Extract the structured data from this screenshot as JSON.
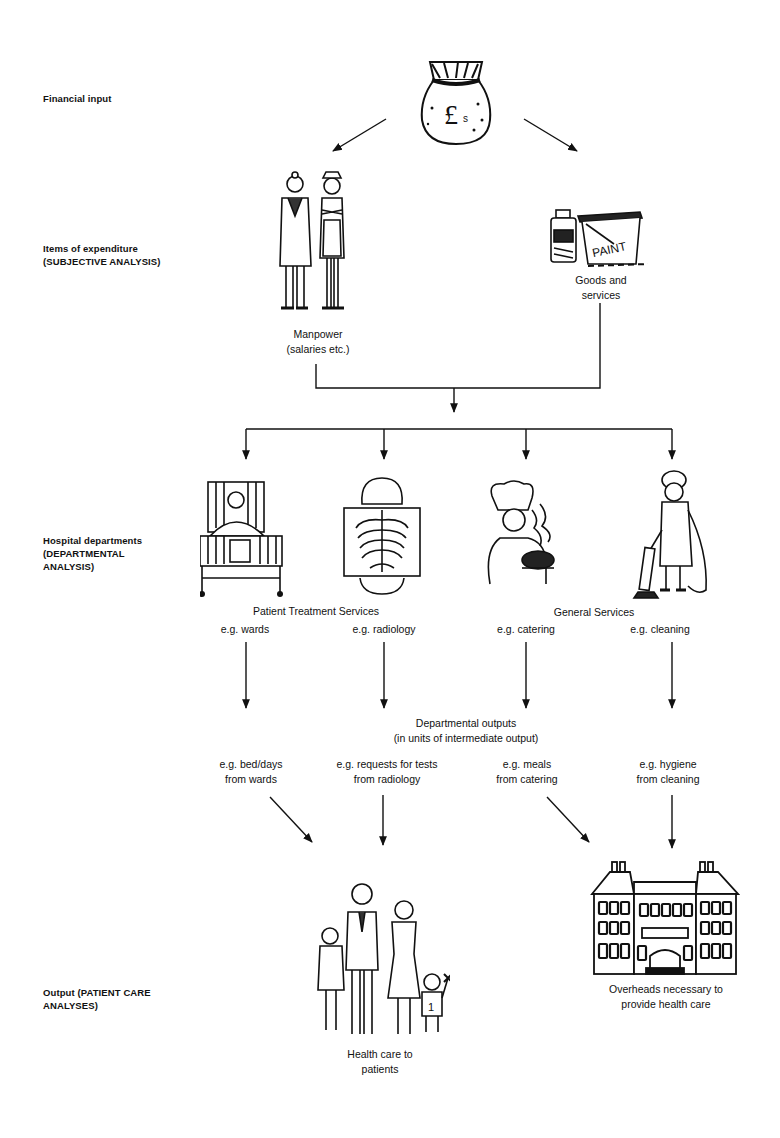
{
  "levels": {
    "financial_input": "Financial input",
    "items_of_expenditure": [
      "Items of expenditure",
      "(SUBJECTIVE ANALYSIS)"
    ],
    "hospital_departments": [
      "Hospital departments",
      "(DEPARTMENTAL",
      "ANALYSIS)"
    ],
    "output": [
      "Output (PATIENT CARE",
      "ANALYSES)"
    ]
  },
  "icons": {
    "money_bag": "money-bag-pound-icon",
    "manpower": "doctor-and-nurse-icon",
    "goods": "medicine-bottle-and-paint-can-icon",
    "wards": "hospital-bed-icon",
    "radiology": "x-ray-icon",
    "catering": "chef-icon",
    "cleaning": "cleaner-with-vacuum-icon",
    "patients": "family-icon",
    "overheads": "hospital-building-icon"
  },
  "expenditure": {
    "manpower": [
      "Manpower",
      "(salaries etc.)"
    ],
    "goods": [
      "Goods and",
      "services"
    ]
  },
  "departments": {
    "patient_treatment": "Patient Treatment Services",
    "general": "General Services",
    "items": [
      "e.g. wards",
      "e.g. radiology",
      "e.g. catering",
      "e.g. cleaning"
    ]
  },
  "departmental_outputs": {
    "title": [
      "Departmental outputs",
      "(in units of intermediate output)"
    ],
    "items": [
      [
        "e.g. bed/days",
        "from wards"
      ],
      [
        "e.g. requests for tests",
        "from radiology"
      ],
      [
        "e.g. meals",
        "from catering"
      ],
      [
        "e.g. hygiene",
        "from cleaning"
      ]
    ]
  },
  "outputs": {
    "patients": [
      "Health care to",
      "patients"
    ],
    "overheads": [
      "Overheads necessary to",
      "provide health care"
    ]
  },
  "colors": {
    "ink": "#111111",
    "background": "#ffffff"
  }
}
